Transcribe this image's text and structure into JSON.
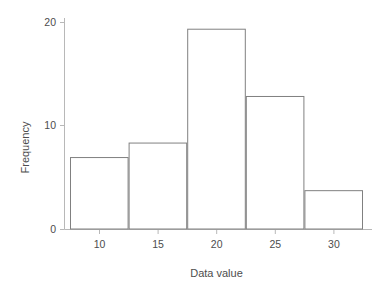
{
  "chart_data": {
    "type": "bar",
    "subtype": "histogram",
    "title": "",
    "xlabel": "Data value",
    "ylabel": "Frequency",
    "xlim": [
      7.5,
      32.5
    ],
    "ylim": [
      0,
      20.6
    ],
    "grid": false,
    "legend": false,
    "bin_width": 5,
    "bin_edges": [
      7.5,
      12.5,
      17.5,
      22.5,
      27.5,
      32.5
    ],
    "categories": [
      "7.5-12.5",
      "12.5-17.5",
      "17.5-22.5",
      "22.5-27.5",
      "27.5-32.5"
    ],
    "values": [
      7,
      8.4,
      19.4,
      12.9,
      3.8
    ],
    "bars": [
      {
        "x0": 7.5,
        "x1": 12.5,
        "height": 7
      },
      {
        "x0": 12.5,
        "x1": 17.5,
        "height": 8.4
      },
      {
        "x0": 17.5,
        "x1": 22.5,
        "height": 19.4
      },
      {
        "x0": 22.5,
        "x1": 27.5,
        "height": 12.9
      },
      {
        "x0": 27.5,
        "x1": 32.5,
        "height": 3.8
      }
    ],
    "xticks": [
      10,
      15,
      20,
      25,
      30
    ],
    "xtick_labels": [
      "10",
      "15",
      "20",
      "25",
      "30"
    ],
    "yticks": [
      0,
      10,
      20
    ],
    "ytick_labels": [
      "0",
      "10",
      "20"
    ],
    "colors": {
      "bar_face": "#ffffff",
      "bar_edge": "#808080",
      "axis": "#b3b3b3",
      "text": "#4d4d4d",
      "background": "#ffffff"
    }
  },
  "axes": {
    "x_label_text": "Data value",
    "y_label_text": "Frequency"
  },
  "ticks": {
    "y": [
      {
        "label": "20"
      },
      {
        "label": "10"
      },
      {
        "label": "0"
      }
    ],
    "x": [
      {
        "label": "10"
      },
      {
        "label": "15"
      },
      {
        "label": "20"
      },
      {
        "label": "25"
      },
      {
        "label": "30"
      }
    ]
  }
}
